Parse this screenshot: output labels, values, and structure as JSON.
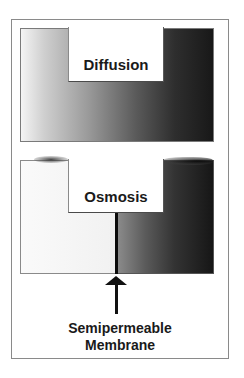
{
  "diagram": {
    "panels": [
      {
        "id": "diffusion",
        "label": "Diffusion",
        "gradient": {
          "from": "#f4f4f4",
          "to": "#181818",
          "direction": "left-to-right"
        }
      },
      {
        "id": "osmosis",
        "label": "Osmosis",
        "left_color": "#f4f4f4",
        "right_gradient": {
          "from": "#8c8c8c",
          "to": "#161616"
        }
      }
    ],
    "annotation": {
      "line1": "Semipermeable",
      "line2": "Membrane",
      "arrow": "up-arrow"
    }
  }
}
